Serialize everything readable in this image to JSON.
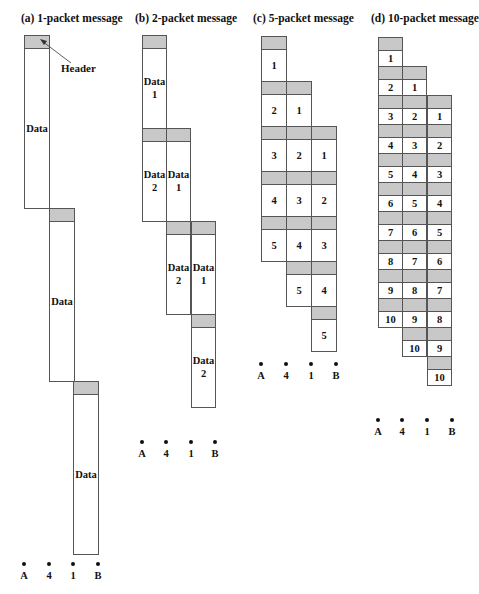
{
  "panels": [
    {
      "id": "a",
      "title": "(a) 1-packet message",
      "title_x": 21
    },
    {
      "id": "b",
      "title": "(b) 2-packet message",
      "title_x": 135
    },
    {
      "id": "c",
      "title": "(c) 5-packet message",
      "title_x": 253
    },
    {
      "id": "d",
      "title": "(d) 10-packet message",
      "title_x": 371
    }
  ],
  "header_label": "Header",
  "nodes": [
    "A",
    "4",
    "1",
    "B"
  ],
  "colors": {
    "header_fill": "#c8c8c8",
    "border": "#555555"
  },
  "panel_a": {
    "packet_label": "Data"
  },
  "panel_b": {
    "packet_labels": [
      "Data\n1",
      "Data\n2"
    ]
  },
  "panel_c": {
    "packet_labels": [
      "1",
      "2",
      "3",
      "4",
      "5"
    ]
  },
  "panel_d": {
    "packet_labels": [
      "1",
      "2",
      "3",
      "4",
      "5",
      "6",
      "7",
      "8",
      "9",
      "10"
    ]
  }
}
